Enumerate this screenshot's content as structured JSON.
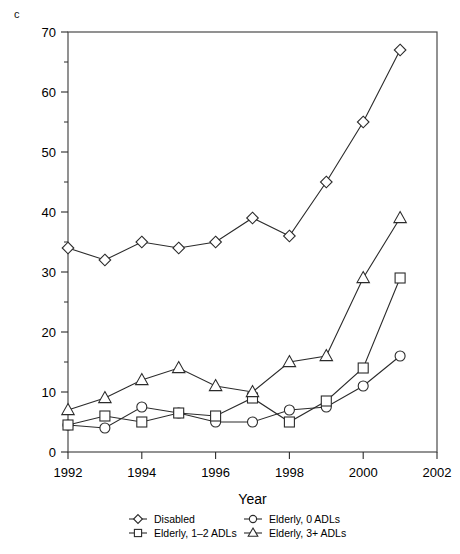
{
  "panel": {
    "label": "c"
  },
  "chart_data": {
    "type": "line",
    "title": "",
    "subtitle": "",
    "xlabel": "Year",
    "ylabel": "",
    "xlim": [
      1992,
      2002
    ],
    "ylim": [
      0,
      70
    ],
    "x_ticks": [
      1992,
      1994,
      1996,
      1998,
      2000,
      2002
    ],
    "x_tick_labels": [
      "1992",
      "1994",
      "1996",
      "1998",
      "2000",
      "2002"
    ],
    "x_minor_ticks": [
      1993,
      1995,
      1997,
      1999,
      2001
    ],
    "y_ticks": [
      0,
      10,
      20,
      30,
      40,
      50,
      60,
      70
    ],
    "y_tick_labels": [
      "0",
      "10",
      "20",
      "30",
      "40",
      "50",
      "60",
      "70"
    ],
    "y_minor_ticks": [
      5,
      15,
      25,
      35,
      45,
      55,
      65
    ],
    "grid": false,
    "legend_position": "bottom",
    "x": [
      1992,
      1993,
      1994,
      1995,
      1996,
      1997,
      1998,
      1999,
      2000,
      2001
    ],
    "series": [
      {
        "name": "Disabled",
        "marker": "diamond",
        "values": [
          34,
          32,
          35,
          34,
          35,
          39,
          36,
          45,
          55,
          67
        ]
      },
      {
        "name": "Elderly, 0 ADLs",
        "marker": "circle",
        "values": [
          4.5,
          4,
          7.5,
          6.5,
          5,
          5,
          7,
          7.5,
          11,
          16
        ]
      },
      {
        "name": "Elderly, 1–2 ADLs",
        "marker": "square",
        "values": [
          4.5,
          6,
          5,
          6.5,
          6,
          9,
          5,
          8.5,
          14,
          29
        ]
      },
      {
        "name": "Elderly, 3+ ADLs",
        "marker": "triangle",
        "values": [
          7,
          9,
          12,
          14,
          11,
          10,
          15,
          16,
          29,
          39
        ]
      }
    ]
  },
  "legend": {
    "entries": [
      {
        "label": "Disabled",
        "marker": "diamond"
      },
      {
        "label": "Elderly, 0 ADLs",
        "marker": "circle"
      },
      {
        "label": "Elderly, 1–2 ADLs",
        "marker": "square"
      },
      {
        "label": "Elderly, 3+ ADLs",
        "marker": "triangle"
      }
    ]
  }
}
